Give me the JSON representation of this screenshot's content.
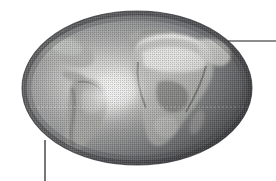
{
  "figure": {
    "title": "Earth globe illustration",
    "caption": "",
    "background_color": "#ffffff",
    "width": 276,
    "height": 181,
    "style": "halftone dithered grayscale engraving"
  },
  "globe": {
    "name": "earth-globe",
    "shape": "ellipse",
    "center_x": 137,
    "center_y": 88,
    "radius_x": 115,
    "radius_y": 77,
    "projection": "oblique orthographic, Africa-centered",
    "ocean_color": "#8f9093",
    "ocean_dark_color": "#4a4b4e",
    "ocean_light_color": "#c9cacb",
    "land_color": "#b9bab8",
    "land_bright_color": "#f2f2f0",
    "land_dark_color": "#5e5f5c",
    "outline_color": "#3a3b3d",
    "highlight_color": "#fbfbfa",
    "highlight_x": 108,
    "highlight_y": 92,
    "terminator_note": "light falls from center-left, shadow toward right and bottom edges"
  },
  "landmasses": [
    {
      "name": "africa",
      "label": "Africa",
      "tone": "bright"
    },
    {
      "name": "sahara-desert",
      "label": "Sahara",
      "tone": "brightest"
    },
    {
      "name": "europe",
      "label": "Europe",
      "tone": "mid"
    },
    {
      "name": "middle-east",
      "label": "Middle East",
      "tone": "bright"
    },
    {
      "name": "south-america",
      "label": "South America",
      "tone": "mid"
    },
    {
      "name": "north-america",
      "label": "North America",
      "tone": "mid"
    },
    {
      "name": "arabian-peninsula",
      "label": "Arabian Peninsula",
      "tone": "bright"
    },
    {
      "name": "madagascar",
      "label": "Madagascar",
      "tone": "mid"
    }
  ],
  "graticule": {
    "equator": {
      "name": "equator-line",
      "visible": true,
      "y": 107,
      "style": "dotted",
      "color": "#e8e8e6"
    }
  },
  "leader_lines": [
    {
      "name": "leader-line-upper-right",
      "orientation": "horizontal",
      "x1": 228,
      "y1": 41,
      "x2": 276,
      "y2": 41,
      "color": "#1c1c1c",
      "width": 1.2
    },
    {
      "name": "leader-line-lower-left",
      "orientation": "vertical",
      "x1": 45,
      "y1": 140,
      "x2": 45,
      "y2": 181,
      "color": "#1c1c1c",
      "width": 1.2
    }
  ]
}
